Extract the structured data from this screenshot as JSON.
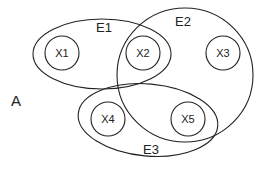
{
  "diagram": {
    "type": "hypergraph",
    "label": "A",
    "stroke_color": "#222222",
    "background": "#ffffff",
    "vertices": [
      {
        "id": "X1",
        "label": "X1",
        "cx": 62,
        "cy": 53,
        "r": 17
      },
      {
        "id": "X2",
        "label": "X2",
        "cx": 143,
        "cy": 53,
        "r": 17
      },
      {
        "id": "X3",
        "label": "X3",
        "cx": 223,
        "cy": 53,
        "r": 17
      },
      {
        "id": "X4",
        "label": "X4",
        "cx": 108,
        "cy": 119,
        "r": 17
      },
      {
        "id": "X5",
        "label": "X5",
        "cx": 188,
        "cy": 119,
        "r": 17
      }
    ],
    "hyperedges": [
      {
        "id": "E1",
        "label": "E1",
        "members": [
          "X1",
          "X2"
        ]
      },
      {
        "id": "E2",
        "label": "E2",
        "members": [
          "X2",
          "X3",
          "X5"
        ]
      },
      {
        "id": "E3",
        "label": "E3",
        "members": [
          "X4",
          "X5"
        ]
      }
    ]
  }
}
